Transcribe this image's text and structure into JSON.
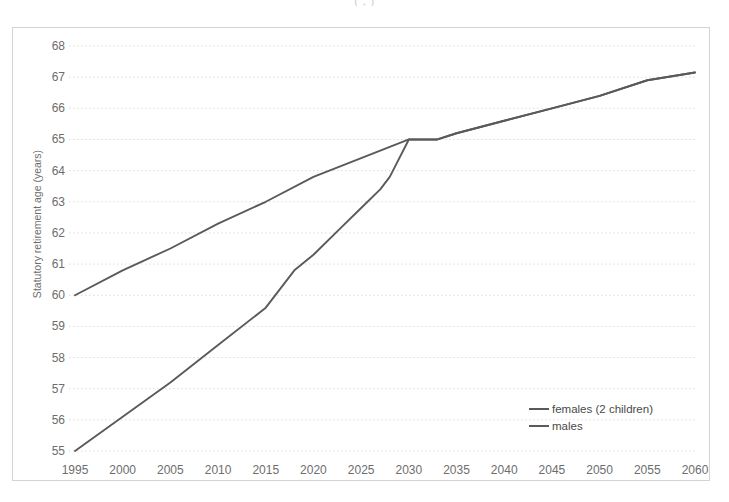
{
  "figure": {
    "cropped_title_fragment": "(                 ,                 )"
  },
  "chart_data": {
    "type": "line",
    "title": "",
    "xlabel": "",
    "ylabel": "Statutory retirement age (years)",
    "xlim": [
      1995,
      2060
    ],
    "ylim": [
      55,
      68
    ],
    "xticks": [
      1995,
      2000,
      2005,
      2010,
      2015,
      2020,
      2025,
      2030,
      2035,
      2040,
      2045,
      2050,
      2055,
      2060
    ],
    "yticks": [
      55,
      56,
      57,
      58,
      59,
      60,
      61,
      62,
      63,
      64,
      65,
      66,
      67,
      68
    ],
    "grid": "horizontal-dotted",
    "legend_position": "inside-bottom-right",
    "line_color": "#5a5a5a",
    "series": [
      {
        "name": "females (2 children)",
        "x": [
          1995,
          2000,
          2005,
          2010,
          2015,
          2018,
          2020,
          2023,
          2025,
          2027,
          2028,
          2030,
          2031,
          2033,
          2035,
          2040,
          2045,
          2050,
          2055,
          2060
        ],
        "values": [
          55.0,
          56.1,
          57.2,
          58.4,
          59.6,
          60.8,
          61.3,
          62.2,
          62.8,
          63.4,
          63.8,
          65.0,
          65.0,
          65.0,
          65.2,
          65.6,
          66.0,
          66.4,
          66.9,
          67.15
        ]
      },
      {
        "name": "males",
        "x": [
          1995,
          2000,
          2005,
          2010,
          2015,
          2020,
          2025,
          2030,
          2031,
          2033,
          2035,
          2040,
          2045,
          2050,
          2055,
          2060
        ],
        "values": [
          60.0,
          60.8,
          61.5,
          62.3,
          63.0,
          63.8,
          64.4,
          65.0,
          65.0,
          65.0,
          65.2,
          65.6,
          66.0,
          66.4,
          66.9,
          67.15
        ]
      }
    ]
  },
  "legend": {
    "items": [
      {
        "label": "females (2 children)"
      },
      {
        "label": "males"
      }
    ]
  }
}
